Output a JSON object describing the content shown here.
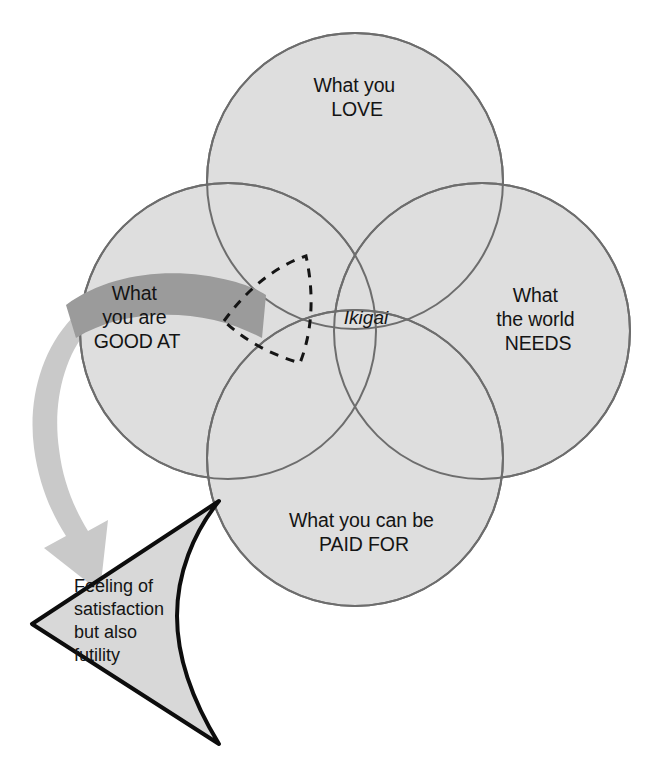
{
  "diagram": {
    "center_label": "Ikigai",
    "circles": [
      {
        "id": "love",
        "line1": "What you",
        "line2": "LOVE"
      },
      {
        "id": "good_at",
        "line1": "What",
        "line2": "you are",
        "line3": "GOOD AT"
      },
      {
        "id": "needs",
        "line1": "What",
        "line2": "the world",
        "line3": "NEEDS"
      },
      {
        "id": "paid",
        "line1": "What you can be",
        "line2": "PAID FOR"
      }
    ],
    "callout": {
      "line1": "Feeling of",
      "line2": "satisfaction",
      "line3": "but also",
      "line4": "futility"
    },
    "colors": {
      "circle_fill": "#dedede",
      "circle_stroke": "#6d6d6d",
      "highlight_arrow": "#9b9b9b",
      "pointer_arrow": "#c9c9c9",
      "callout_fill": "#d8d8d8",
      "callout_stroke": "#0d0d0d",
      "dashed_stroke": "#151515",
      "text": "#141414",
      "background": "#ffffff"
    }
  }
}
